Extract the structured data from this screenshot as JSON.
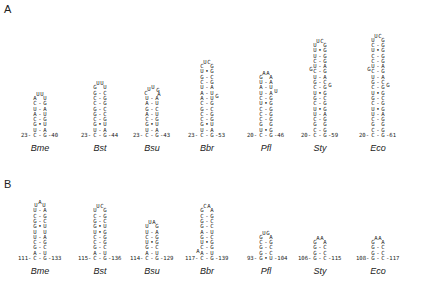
{
  "figure": {
    "panels": [
      {
        "label": "A",
        "label_pos": [
          4,
          3
        ],
        "species_y": 143,
        "base_y": 132,
        "hairpins": [
          {
            "species": "Bme",
            "cx": 40,
            "left_num": "23",
            "right_num": "40",
            "loop": [
              "A",
              "U",
              "U",
              "U"
            ],
            "stem": [
              [
                "C",
                "-",
                "G"
              ],
              [
                "U",
                "-",
                "A"
              ],
              [
                "A",
                "-",
                "U"
              ],
              [
                "C",
                "-",
                "G"
              ],
              [
                "G",
                "•",
                "U"
              ],
              [
                "U",
                "-",
                "A"
              ],
              [
                "C",
                "-",
                "G"
              ]
            ]
          },
          {
            "species": "Bst",
            "cx": 100,
            "left_num": "23",
            "right_num": "44",
            "loop": [
              "G",
              "U",
              "U",
              "U"
            ],
            "stem": [
              [
                "G",
                "-",
                "C"
              ],
              [
                "C",
                "-",
                "G"
              ],
              [
                "C",
                "-",
                "G"
              ],
              [
                "G",
                "-",
                "C"
              ],
              [
                "G",
                "-",
                "C"
              ],
              [
                "C",
                "-",
                "G"
              ],
              [
                "G",
                "•",
                "U"
              ],
              [
                "U",
                "-",
                "A"
              ],
              [
                "C",
                "-",
                "G"
              ]
            ]
          },
          {
            "species": "Bsu",
            "cx": 152,
            "left_num": "23",
            "right_num": "43",
            "loop": [
              "C",
              "U",
              "U",
              "G",
              "A"
            ],
            "stem": [
              [
                "U",
                "-",
                "A"
              ],
              [
                "A",
                "-",
                "U"
              ],
              [
                "G",
                "-",
                "C"
              ],
              [
                "A",
                "-",
                "U"
              ],
              [
                "C",
                "-",
                "G"
              ],
              [
                "G",
                "•",
                "U"
              ],
              [
                "U",
                "-",
                "A"
              ],
              [
                "C",
                "-",
                "G"
              ]
            ]
          },
          {
            "species": "Bbr",
            "cx": 207,
            "left_num": "23",
            "right_num": "53",
            "loop": [
              "C",
              "U",
              "C",
              "G"
            ],
            "stem": [
              [
                "U",
                "•",
                "G"
              ],
              [
                "G",
                "-",
                "C"
              ],
              [
                "C",
                "-",
                "G"
              ],
              [
                "U",
                "-",
                "A"
              ],
              [
                "A",
                "-",
                "U"
              ],
              [
                "A",
                "-",
                "U",
                null,
                "G"
              ],
              [
                "C",
                "-",
                "G"
              ],
              [
                "G",
                "-",
                "C"
              ],
              [
                "C",
                "-",
                "G"
              ],
              [
                "C",
                "-",
                "G"
              ],
              [
                "G",
                "•",
                "U"
              ],
              [
                "U",
                "-",
                "A"
              ],
              [
                "C",
                "-",
                "G"
              ]
            ]
          },
          {
            "species": "Pfl",
            "cx": 266,
            "left_num": "20",
            "right_num": "46",
            "loop": [
              "G",
              "A",
              "A",
              "A"
            ],
            "stem": [
              [
                "U",
                "-",
                "A"
              ],
              [
                "A",
                "-",
                "U"
              ],
              [
                "U",
                "-",
                "A",
                null,
                "U"
              ],
              [
                "C",
                "-",
                "G"
              ],
              [
                "U",
                "•",
                "G"
              ],
              [
                "C",
                "-",
                "G"
              ],
              [
                "C",
                "-",
                "G"
              ],
              [
                "C",
                "-",
                "G"
              ],
              [
                "G",
                " ",
                "G"
              ],
              [
                "U",
                "•",
                "G"
              ],
              [
                "C",
                "-",
                "G"
              ]
            ]
          },
          {
            "species": "Sty",
            "cx": 320,
            "left_num": "20",
            "right_num": "59",
            "loop": [
              "U",
              "U",
              "C",
              "G"
            ],
            "stem": [
              [
                "U",
                "•",
                "G"
              ],
              [
                "U",
                "-",
                "G"
              ],
              [
                "C",
                "-",
                "G"
              ],
              [
                "U",
                "-",
                "A"
              ],
              [
                "C",
                "-",
                "G",
                "G",
                null
              ],
              [
                "U",
                "-",
                "A"
              ],
              [
                "G",
                "-",
                "C"
              ],
              [
                "C",
                "-",
                "G",
                null,
                "G"
              ],
              [
                "U",
                "•",
                "G"
              ],
              [
                "G",
                "-",
                "C"
              ],
              [
                "C",
                "-",
                "G"
              ],
              [
                "U",
                "•",
                "G"
              ],
              [
                "U",
                "-",
                "A"
              ],
              [
                "C",
                "-",
                "G"
              ],
              [
                "G",
                " ",
                "G"
              ],
              [
                "C",
                "-",
                "G"
              ],
              [
                "C",
                "-",
                "G"
              ]
            ]
          },
          {
            "species": "Eco",
            "cx": 378,
            "left_num": "20",
            "right_num": "61",
            "loop": [
              "U",
              "U",
              "C",
              "G"
            ],
            "stem": [
              [
                "C",
                "-",
                "G"
              ],
              [
                "U",
                "•",
                "G"
              ],
              [
                "C",
                "-",
                "G"
              ],
              [
                "C",
                "-",
                "G"
              ],
              [
                "U",
                "-",
                "A"
              ],
              [
                "C",
                "-",
                "G",
                "G",
                null
              ],
              [
                "U",
                "-",
                "A"
              ],
              [
                "G",
                "-",
                "C"
              ],
              [
                "C",
                "-",
                "G",
                null,
                "G"
              ],
              [
                "U",
                "•",
                "G"
              ],
              [
                "G",
                "-",
                "C"
              ],
              [
                "C",
                "-",
                "G"
              ],
              [
                "U",
                "•",
                "G"
              ],
              [
                "U",
                "-",
                "A"
              ],
              [
                "C",
                "-",
                "G"
              ],
              [
                "G",
                " ",
                "G"
              ],
              [
                "C",
                "-",
                "G"
              ],
              [
                "C",
                "-",
                "G"
              ]
            ]
          }
        ]
      },
      {
        "label": "B",
        "label_pos": [
          4,
          178
        ],
        "species_y": 266,
        "base_y": 255,
        "hairpins": [
          {
            "species": "Bme",
            "cx": 40,
            "left_num": "111",
            "right_num": "133",
            "loop": [
              "U",
              "A",
              "U"
            ],
            "stem": [
              [
                "U",
                "-",
                "A"
              ],
              [
                "C",
                "-",
                "G"
              ],
              [
                "G",
                "-",
                "C"
              ],
              [
                "G",
                "•",
                "U"
              ],
              [
                "U",
                " ",
                "U"
              ],
              [
                "U",
                "-",
                "A"
              ],
              [
                "C",
                "-",
                "G"
              ],
              [
                "G",
                "-",
                "C"
              ],
              [
                "A",
                "-",
                "U"
              ],
              [
                "C",
                "-",
                "G"
              ]
            ]
          },
          {
            "species": "Bst",
            "cx": 100,
            "left_num": "115",
            "right_num": "136",
            "loop": [
              "U",
              "U",
              "C",
              "G"
            ],
            "stem": [
              [
                "C",
                "-",
                "G"
              ],
              [
                "G",
                "-",
                "C"
              ],
              [
                "G",
                "•",
                "U"
              ],
              [
                "U",
                "•",
                "G"
              ],
              [
                "C",
                "-",
                "G"
              ],
              [
                "C",
                "-",
                "G"
              ],
              [
                "G",
                "-",
                "C"
              ],
              [
                "A",
                "-",
                "U"
              ],
              [
                "C",
                "-",
                "G"
              ]
            ]
          },
          {
            "species": "Bsu",
            "cx": 152,
            "left_num": "114",
            "right_num": "129",
            "loop": [
              "U",
              "U",
              "A",
              "G"
            ],
            "stem": [
              [
                "U",
                "-",
                "A"
              ],
              [
                "C",
                "-",
                "G"
              ],
              [
                "U",
                "•",
                "G"
              ],
              [
                "G",
                "-",
                "C"
              ],
              [
                "A",
                "-",
                "U"
              ],
              [
                "C",
                "-",
                "G"
              ]
            ]
          },
          {
            "species": "Bbr",
            "cx": 207,
            "left_num": "117",
            "right_num": "139",
            "loop": [
              "G",
              "C",
              "A",
              "A"
            ],
            "stem": [
              [
                "C",
                "-",
                "G"
              ],
              [
                "G",
                "-",
                "C"
              ],
              [
                "G",
                "-",
                "C"
              ],
              [
                "A",
                "-",
                "U"
              ],
              [
                "G",
                "-",
                "C"
              ],
              [
                "U",
                "•",
                "G"
              ],
              [
                "C",
                "-",
                "G"
              ],
              [
                "A",
                "-",
                "U",
                "A",
                null
              ],
              [
                "C",
                "-",
                "G"
              ]
            ]
          },
          {
            "species": "Pfl",
            "cx": 266,
            "left_num": "93",
            "right_num": "104",
            "loop": [
              "G",
              "U",
              "G",
              "A"
            ],
            "stem": [
              [
                "C",
                "-",
                "G"
              ],
              [
                "G",
                "-",
                "C"
              ],
              [
                "G",
                "-",
                "C"
              ],
              [
                "G",
                "•",
                "U"
              ]
            ]
          },
          {
            "species": "Sty",
            "cx": 320,
            "left_num": "106",
            "right_num": "115",
            "loop": [
              "G",
              "A",
              "A",
              "A"
            ],
            "stem": [
              [
                "G",
                "-",
                "C"
              ],
              [
                "G",
                "-",
                "C"
              ],
              [
                "G",
                "-",
                "C"
              ]
            ]
          },
          {
            "species": "Eco",
            "cx": 378,
            "left_num": "108",
            "right_num": "117",
            "loop": [
              "G",
              "A",
              "A",
              "A"
            ],
            "stem": [
              [
                "G",
                "-",
                "C"
              ],
              [
                "G",
                "-",
                "C"
              ],
              [
                "G",
                "-",
                "C"
              ]
            ]
          }
        ]
      }
    ]
  }
}
